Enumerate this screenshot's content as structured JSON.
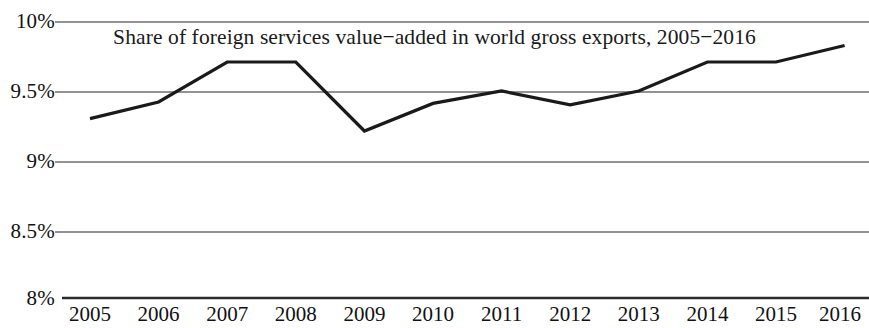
{
  "chart_data": {
    "type": "line",
    "title": "Share of foreign services value−added in world gross exports, 2005−2016",
    "xlabel": "",
    "ylabel": "",
    "categories": [
      "2005",
      "2006",
      "2007",
      "2008",
      "2009",
      "2010",
      "2011",
      "2012",
      "2013",
      "2014",
      "2015",
      "2016"
    ],
    "x": [
      2005,
      2006,
      2007,
      2008,
      2009,
      2010,
      2011,
      2012,
      2013,
      2014,
      2015,
      2016
    ],
    "values": [
      9.3,
      9.42,
      9.71,
      9.71,
      9.21,
      9.41,
      9.5,
      9.4,
      9.5,
      9.71,
      9.71,
      9.83
    ],
    "series": [
      {
        "name": "Share of foreign services value−added in world gross exports",
        "values": [
          9.3,
          9.42,
          9.71,
          9.71,
          9.21,
          9.41,
          9.5,
          9.4,
          9.5,
          9.71,
          9.71,
          9.83
        ]
      }
    ],
    "ylim": [
      8,
      10
    ],
    "ytick_values": [
      10,
      9.5,
      9,
      8.5,
      8
    ],
    "ytick_labels": [
      "10%",
      "9.5%",
      "9%",
      "8.5%",
      "8%"
    ],
    "xtick_labels": [
      "2005",
      "2006",
      "2007",
      "2008",
      "2009",
      "2010",
      "2011",
      "2012",
      "2013",
      "2014",
      "2015",
      "2016"
    ],
    "grid": true,
    "grid_axis": "y",
    "legend": false,
    "legend_position": "none",
    "units": "percent",
    "line_color": "#1a1a1a",
    "grid_color": "#6e6e6e",
    "axis_color": "#2b2b2b",
    "background_color": "#ffffff",
    "markers": false,
    "line_width": 3.2
  }
}
